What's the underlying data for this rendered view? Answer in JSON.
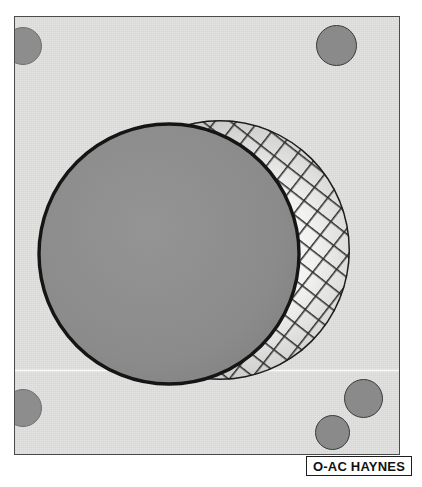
{
  "figure": {
    "caption": "O-AC HAYNES",
    "background_color": "#ffffff",
    "panel": {
      "name": "specimen-plate",
      "fill_color": "#e3e3e1",
      "border_color": "#4b4b4b",
      "x": 14,
      "y": 16,
      "width": 386,
      "height": 439
    },
    "corner_holes": [
      {
        "label": "top-left-hole",
        "x": 0,
        "y": 10,
        "d": 38,
        "style": "soft",
        "clipped": true
      },
      {
        "label": "top-right-hole",
        "x": 300,
        "y": 8,
        "d": 41,
        "style": "outlined",
        "clipped": false
      },
      {
        "label": "bottom-left-hole",
        "x": 0,
        "y": 372,
        "d": 38,
        "style": "soft",
        "clipped": true
      },
      {
        "label": "bottom-right-upper-hole",
        "x": 328,
        "y": 364,
        "d": 38,
        "style": "outlined",
        "clipped": false
      },
      {
        "label": "bottom-right-lower-hole",
        "x": 300,
        "y": 398,
        "d": 34,
        "style": "outlined",
        "clipped": false
      }
    ],
    "scan_band": {
      "label": "scan-line-artifact",
      "y": 352
    },
    "solid_sphere": {
      "label": "solid-sphere",
      "cx": 154,
      "cy": 237,
      "r": 130,
      "fill_color": "#8b8b8b",
      "outline_color": "#1c1c1c"
    },
    "mesh_sphere": {
      "label": "wireframe-mesh-sphere",
      "cx": 205,
      "cy": 233,
      "r": 130,
      "fill_color": "#d8d8d6",
      "outline_color": "#1c1c1c",
      "grid_color": "#2a2a2a",
      "grid_spacing": 16,
      "grid_angle_deg": 38,
      "highlight_color": "#fbfbfa"
    }
  }
}
